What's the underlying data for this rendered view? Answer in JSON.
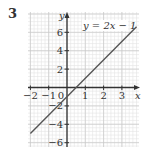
{
  "problem": {
    "number": "3"
  },
  "chart_data": {
    "type": "line",
    "title": "",
    "annotation": "y = 2x − 1",
    "xlabel": "x",
    "ylabel": "y",
    "xlim": [
      -2,
      3.5
    ],
    "ylim": [
      -6,
      7
    ],
    "x_ticks": [
      -2,
      -1,
      1,
      2,
      3
    ],
    "x_tick_labels": [
      "−2",
      "−1",
      "1",
      "2",
      "3"
    ],
    "y_ticks": [
      -6,
      -4,
      -2,
      2,
      4,
      6
    ],
    "y_tick_labels": [
      "−6",
      "−4",
      "−2",
      "2",
      "4",
      "6"
    ],
    "origin_label": "0",
    "grid": true,
    "series": [
      {
        "name": "y = 2x − 1",
        "slope": 2,
        "intercept": -1,
        "x": [
          -2,
          3.8
        ],
        "y": [
          -5,
          6.6
        ]
      }
    ],
    "colors": {
      "line": "#555555",
      "axes": "#333333",
      "grid_major": "#c8c8c8",
      "grid_minor": "#e4e4e4",
      "text": "#333333"
    }
  }
}
